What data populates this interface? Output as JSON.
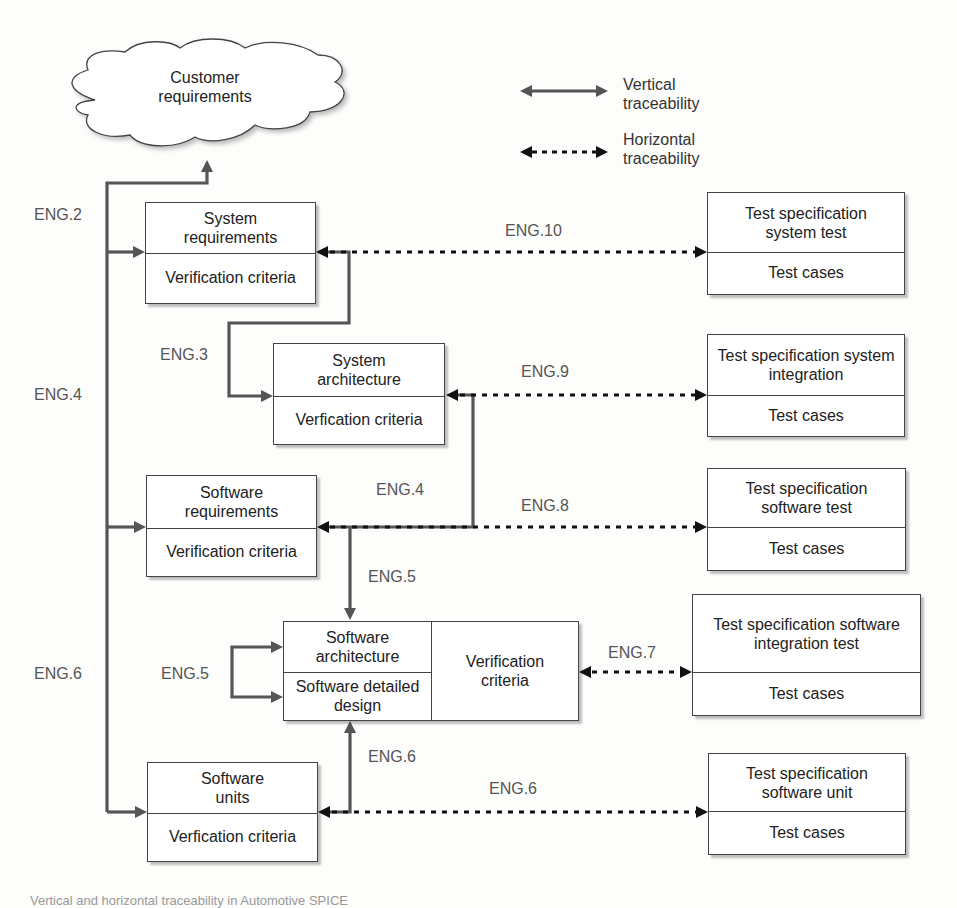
{
  "cloud": {
    "line1": "Customer",
    "line2": "requirements"
  },
  "legend": {
    "vertical": {
      "line1": "Vertical",
      "line2": "traceability"
    },
    "horizontal": {
      "line1": "Horizontal",
      "line2": "traceability"
    }
  },
  "left_boxes": [
    {
      "top": "System requirements",
      "bottom": "Verification criteria"
    },
    {
      "top": "System architecture",
      "bottom": "Verfication criteria"
    },
    {
      "top": "Software requirements",
      "bottom": "Verification criteria"
    },
    {
      "top_a": "Software architecture",
      "top_b": "Software detailed design",
      "right": "Verification criteria"
    },
    {
      "top": "Software units",
      "bottom": "Verfication criteria"
    }
  ],
  "test_boxes": [
    {
      "top": "Test specification system test",
      "bottom": "Test cases"
    },
    {
      "top": "Test specification system integration",
      "bottom": "Test cases"
    },
    {
      "top": "Test specification software test",
      "bottom": "Test cases"
    },
    {
      "top": "Test specification software integration test",
      "bottom": "Test cases"
    },
    {
      "top": "Test specification software unit",
      "bottom": "Test cases"
    }
  ],
  "labels": {
    "eng2": "ENG.2",
    "eng4_left": "ENG.4",
    "eng6_left": "ENG.6",
    "eng3": "ENG.3",
    "eng4_mid": "ENG.4",
    "eng5_down": "ENG.5",
    "eng5_loop": "ENG.5",
    "eng6_up": "ENG.6",
    "eng10": "ENG.10",
    "eng9": "ENG.9",
    "eng8": "ENG.8",
    "eng7": "ENG.7",
    "eng6_h": "ENG.6"
  },
  "caption": "Vertical and horizontal traceability in Automotive SPICE",
  "colors": {
    "vertical_line": "#555555",
    "horizontal_line": "#111111",
    "box_border": "#444444"
  }
}
